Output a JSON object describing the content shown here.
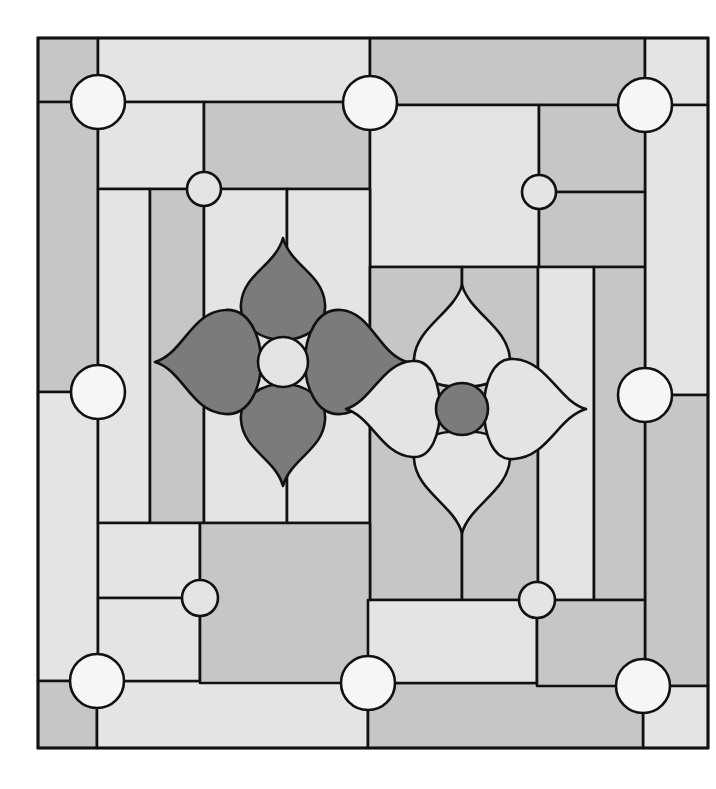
{
  "artwork": {
    "type": "stained-glass-pattern",
    "description": "Square leaded-glass panel with two four-petal flowers, bordered by rectangular panes and round jewels",
    "colors": {
      "lead": "#111111",
      "light_glass": "#e4e4e4",
      "mid_glass": "#c6c6c6",
      "dark_glass": "#7b7b7b",
      "jewel": "#f6f6f6",
      "background": "#ffffff"
    },
    "frame": {
      "x": 38,
      "y": 38,
      "width": 670,
      "height": 710
    },
    "large_jewels": [
      {
        "cx": 98,
        "cy": 102
      },
      {
        "cx": 370,
        "cy": 103
      },
      {
        "cx": 645,
        "cy": 105
      },
      {
        "cx": 98,
        "cy": 392
      },
      {
        "cx": 645,
        "cy": 395
      },
      {
        "cx": 97,
        "cy": 681
      },
      {
        "cx": 368,
        "cy": 683
      },
      {
        "cx": 643,
        "cy": 686
      }
    ],
    "small_jewels": [
      {
        "cx": 204,
        "cy": 189
      },
      {
        "cx": 539,
        "cy": 192
      },
      {
        "cx": 200,
        "cy": 598
      },
      {
        "cx": 537,
        "cy": 600
      }
    ],
    "flowers": [
      {
        "name": "dark-flower",
        "cx": 283,
        "cy": 362,
        "petal_color": "dark",
        "center_color": "light"
      },
      {
        "name": "light-flower",
        "cx": 462,
        "cy": 409,
        "petal_color": "light",
        "center_color": "dark"
      }
    ]
  }
}
